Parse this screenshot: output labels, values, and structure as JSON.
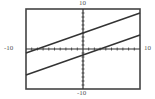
{
  "chart_data": {
    "type": "line",
    "title": "",
    "xlabel": "",
    "ylabel": "",
    "xlim": [
      -10,
      10
    ],
    "ylim": [
      -10,
      10
    ],
    "grid": false,
    "ticks_every": 1,
    "window_labels": {
      "xmin": "-10",
      "xmax": "10",
      "ymin": "-10",
      "ymax": "10"
    },
    "series": [
      {
        "name": "line-upper",
        "equation": "y = 0.5x + 4",
        "x": [
          -10,
          10
        ],
        "y": [
          -1,
          9
        ]
      },
      {
        "name": "line-lower",
        "equation": "y = 0.5x - 1.5",
        "x": [
          -10,
          10
        ],
        "y": [
          -6.5,
          3.5
        ]
      }
    ],
    "colors": {
      "frame": "#444444",
      "axes": "#333333",
      "lines": "#333333"
    }
  }
}
